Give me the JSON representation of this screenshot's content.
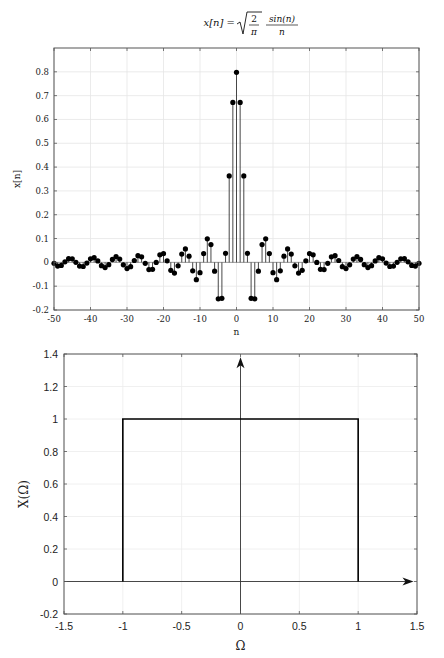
{
  "chart_data": [
    {
      "type": "stem",
      "title": "x[n] = sqrt(2/π) · sin(n)/n",
      "title_parts": {
        "lhs": "x[n] =",
        "sqrt_num": "2",
        "sqrt_den": "π",
        "frac_num": "sin(n)",
        "frac_den": "n"
      },
      "xlabel": "n",
      "ylabel": "x[n]",
      "xlim": [
        -50,
        50
      ],
      "ylim": [
        -0.2,
        0.9
      ],
      "xticks": [
        -50,
        -40,
        -30,
        -20,
        -10,
        0,
        10,
        20,
        30,
        40,
        50
      ],
      "xtick_labels": [
        "-50",
        "-40",
        "-30",
        "-20",
        "-10",
        "0",
        "10",
        "20",
        "30",
        "40",
        "50"
      ],
      "yticks": [
        -0.2,
        -0.1,
        0,
        0.1,
        0.2,
        0.3,
        0.4,
        0.5,
        0.6,
        0.7,
        0.8
      ],
      "ytick_labels": [
        "-0.2",
        "-0.1",
        "0",
        "0.1",
        "0.2",
        "0.3",
        "0.4",
        "0.5",
        "0.6",
        "0.7",
        "0.8"
      ],
      "grid": true,
      "marker": "filled-circle",
      "n_range": [
        -50,
        50
      ],
      "amplitude": 0.7979,
      "sample_values": {
        "n=0": 0.8,
        "n=±1": 0.67,
        "n=±2": 0.36,
        "n=±3": 0.04,
        "n=±4": -0.15,
        "n=±5": -0.15,
        "n=±6": -0.04,
        "n=±7": 0.075,
        "n=±8": 0.099
      }
    },
    {
      "type": "line",
      "title": "",
      "xlabel": "Ω",
      "ylabel": "X(Ω)",
      "xlim": [
        -1.5,
        1.5
      ],
      "ylim": [
        -0.2,
        1.4
      ],
      "xticks": [
        -1.5,
        -1,
        -0.5,
        0,
        0.5,
        1,
        1.5
      ],
      "xtick_labels": [
        "-1.5",
        "-1",
        "-0.5",
        "0",
        "0.5",
        "1",
        "1.5"
      ],
      "yticks": [
        -0.2,
        0,
        0.2,
        0.4,
        0.6,
        0.8,
        1,
        1.2,
        1.4
      ],
      "ytick_labels": [
        "-0.2",
        "0",
        "0.2",
        "0.4",
        "0.6",
        "0.8",
        "1",
        "1.2",
        "1.4"
      ],
      "grid": true,
      "series": [
        {
          "name": "X(Ω) rectangular pulse",
          "x": [
            -1,
            -1,
            1,
            1
          ],
          "y": [
            0,
            1,
            1,
            0
          ]
        }
      ],
      "annotations": [
        "arrow along horizontal axis (y=0) pointing right",
        "arrow along vertical axis (x=0) pointing up"
      ]
    }
  ]
}
